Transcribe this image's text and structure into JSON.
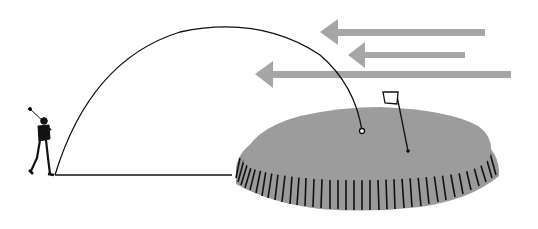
{
  "figure": {
    "colors": {
      "background": "#ffffff",
      "arrow": "#a6a6a6",
      "green": "#9c9c9c",
      "green_edge": "#8e8e8e",
      "line": "#111111"
    },
    "elements": {
      "golfer": "golfer-figure",
      "ground": "ground-line",
      "trajectory": "ball-flight-arc",
      "ball": "golf-ball",
      "green": "putting-green",
      "flag": "pin-flag",
      "wind_arrows": [
        {
          "name": "wind-arrow-top",
          "x1": 485,
          "x2": 320,
          "y": 32
        },
        {
          "name": "wind-arrow-middle",
          "x1": 465,
          "x2": 348,
          "y": 55
        },
        {
          "name": "wind-arrow-bottom",
          "x1": 511,
          "x2": 255,
          "y": 74
        }
      ]
    }
  }
}
